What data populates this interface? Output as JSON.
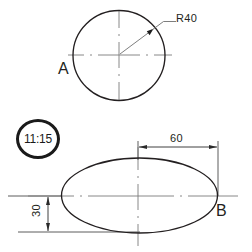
{
  "drawing": {
    "background_color": "#ffffff",
    "line_color": "#231f20",
    "centerline_color": "#6b6b6b",
    "badge_color": "#1a1a1a"
  },
  "views": {
    "top": {
      "tag": "A",
      "shape": "circle",
      "radius_dimension": "R40",
      "radius_label": "R40"
    },
    "bottom": {
      "tag": "B",
      "shape": "ellipse",
      "width_dimension": "60",
      "height_dimension": "30"
    }
  },
  "badge": {
    "icon": "clock-badge",
    "time": "11:15"
  }
}
